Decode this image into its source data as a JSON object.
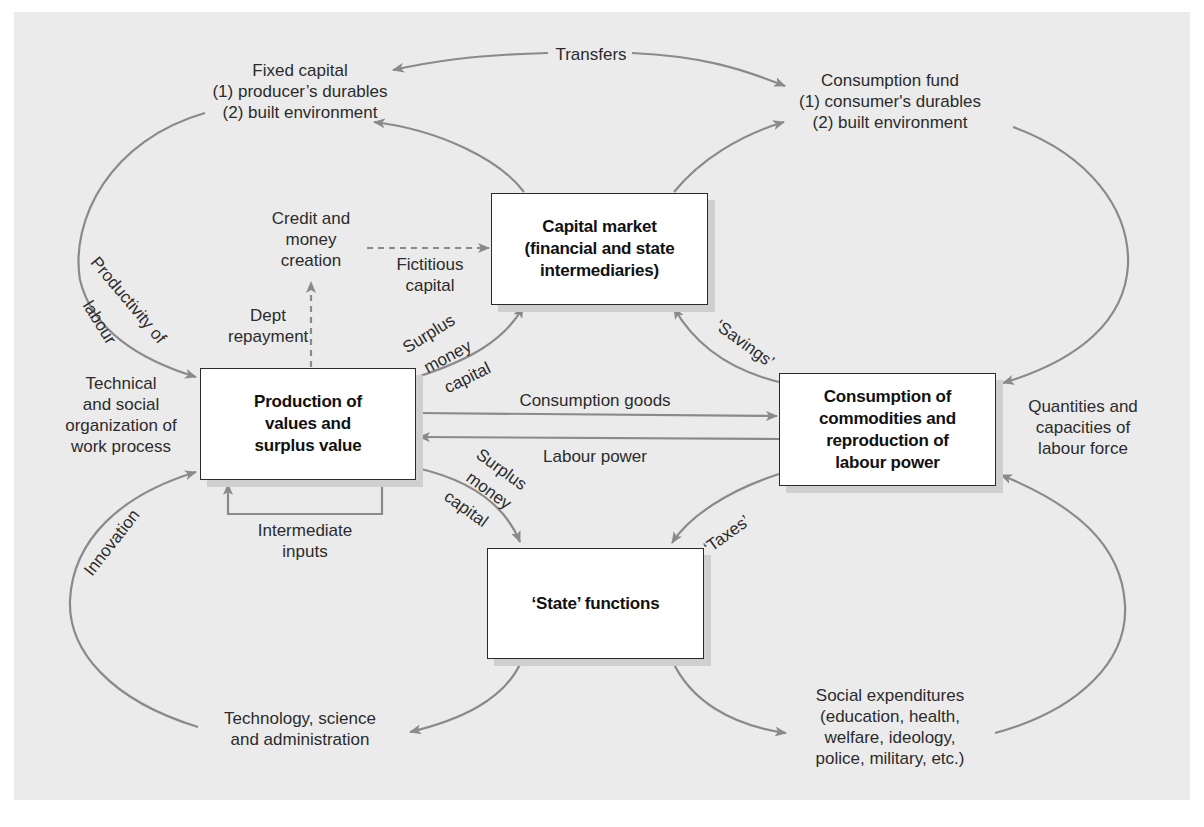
{
  "colors": {
    "panel": "#ebebeb",
    "arrow": "#8a8a8a",
    "box_border": "#2a2a2a",
    "box_fill": "#ffffff",
    "box_shadow": "#cfcfcf",
    "text": "#2b2b2b"
  },
  "boxes": {
    "capital_market": "Capital market\n(financial and state\nintermediaries)",
    "production": "Production of\nvalues and\nsurplus value",
    "consumption": "Consumption of\ncommodities and\nreproduction of\nlabour power",
    "state": "‘State’ functions"
  },
  "labels": {
    "fixed_capital": "Fixed capital\n(1) producer’s durables\n(2) built environment",
    "transfers": "Transfers",
    "consumption_fund": "Consumption fund\n(1) consumer's durables\n(2) built environment",
    "credit_money": "Credit and\nmoney\ncreation",
    "fictitious_capital": "Fictitious\ncapital",
    "dept_repayment": "Dept\nrepayment",
    "productivity_of": "Productivity of",
    "labour": "labour",
    "technical_org": "Technical\nand social\norganization of\nwork process",
    "surplus_money_capital_top_1": "Surplus",
    "surplus_money_capital_top_2": "money",
    "surplus_money_capital_top_3": "capital",
    "savings": "‘Savings’",
    "consumption_goods": "Consumption goods",
    "labour_power": "Labour power",
    "quantities_capacities": "Quantities and\ncapacities of\nlabour force",
    "surplus_money_capital_bottom_1": "Surplus",
    "surplus_money_capital_bottom_2": "money",
    "surplus_money_capital_bottom_3": "capital",
    "taxes": "‘Taxes’",
    "intermediate_inputs": "Intermediate\ninputs",
    "innovation": "Innovation",
    "technology_science": "Technology, science\nand administration",
    "social_expenditures": "Social expenditures\n(education, health,\nwelfare, ideology,\npolice, military, etc.)"
  }
}
